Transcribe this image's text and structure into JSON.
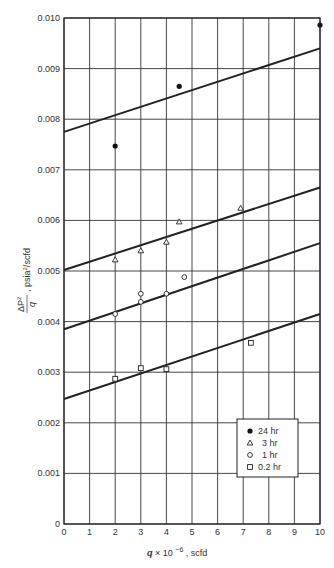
{
  "chart_data": {
    "type": "scatter",
    "title": "",
    "xlabel": "q × 10^-6, scfd",
    "xlabel_parts": {
      "q": "q",
      "times": "× 10",
      "exp": "−6",
      "unit": ", scfd"
    },
    "ylabel": "ΔP²/q, psia²/scfd",
    "ylabel_parts": {
      "num": "ΔP",
      "num_sup": "2",
      "den": "q",
      "unit": "psia",
      "unit_sup": "2",
      "unit_tail": "/scfd"
    },
    "xlim": [
      0,
      10
    ],
    "ylim": [
      0,
      0.01
    ],
    "x_ticks": [
      "0",
      "1",
      "2",
      "3",
      "4",
      "5",
      "6",
      "7",
      "8",
      "9",
      "10"
    ],
    "y_ticks": [
      "0",
      "0.001",
      "0.002",
      "0.003",
      "0.004",
      "0.005",
      "0.006",
      "0.007",
      "0.008",
      "0.009",
      "0.010"
    ],
    "grid": true,
    "legend_position": "lower right",
    "series": [
      {
        "name": "24 hr",
        "marker": "filled-circle",
        "points": [
          [
            2,
            0.00747
          ],
          [
            4.5,
            0.00865
          ],
          [
            10,
            0.00986
          ]
        ],
        "fit_line": [
          [
            0,
            0.00775
          ],
          [
            10,
            0.0094
          ]
        ]
      },
      {
        "name": "3 hr",
        "marker": "triangle",
        "points": [
          [
            2,
            0.00522
          ],
          [
            3,
            0.0054
          ],
          [
            4,
            0.00557
          ],
          [
            4.5,
            0.00597
          ],
          [
            6.9,
            0.00624
          ]
        ],
        "fit_line": [
          [
            0,
            0.00502
          ],
          [
            10,
            0.00665
          ]
        ]
      },
      {
        "name": "1 hr",
        "marker": "open-circle",
        "points": [
          [
            2,
            0.00415
          ],
          [
            3,
            0.00455
          ],
          [
            3,
            0.00439
          ],
          [
            4,
            0.00455
          ],
          [
            4.7,
            0.00488
          ]
        ],
        "fit_line": [
          [
            0,
            0.00385
          ],
          [
            10,
            0.00555
          ]
        ]
      },
      {
        "name": "0.2 hr",
        "marker": "square",
        "points": [
          [
            2,
            0.00287
          ],
          [
            3,
            0.00308
          ],
          [
            4,
            0.00306
          ],
          [
            7.3,
            0.00358
          ]
        ],
        "fit_line": [
          [
            0,
            0.00247
          ],
          [
            10,
            0.00415
          ]
        ]
      }
    ]
  }
}
